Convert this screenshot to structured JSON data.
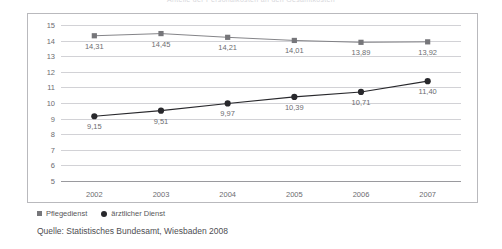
{
  "chart_data": {
    "type": "line",
    "title": "Anteile der Personalkosten an den Gesamtkosten",
    "categories": [
      "2002",
      "2003",
      "2004",
      "2005",
      "2006",
      "2007"
    ],
    "series": [
      {
        "name": "Pflegedienst",
        "marker": "square",
        "color": "#76767a",
        "values": [
          14.31,
          14.45,
          14.21,
          14.01,
          13.89,
          13.92
        ],
        "labels": [
          "14,31",
          "14,45",
          "14,21",
          "14,01",
          "13,89",
          "13,92"
        ]
      },
      {
        "name": "ärztlicher Dienst",
        "marker": "circle",
        "color": "#28282c",
        "values": [
          9.15,
          9.51,
          9.97,
          10.39,
          10.71,
          11.4
        ],
        "labels": [
          "9,15",
          "9,51",
          "9,97",
          "10,39",
          "10,71",
          "11,40"
        ]
      }
    ],
    "ylim": [
      5,
      15
    ],
    "yticks": [
      15,
      14,
      13,
      12,
      11,
      10,
      9,
      8,
      7,
      6,
      5
    ],
    "ytick_labels": [
      "15",
      "14",
      "13",
      "12",
      "11",
      "10",
      "9",
      "8",
      "7",
      "6",
      "5"
    ],
    "xlabel": "",
    "ylabel": "",
    "grid": true,
    "legend_position": "bottom-left"
  },
  "source": {
    "text": "Quelle: Statistisches Bundesamt, Wiesbaden 2008"
  },
  "colors": {
    "grid": "#d2d2d6",
    "axis": "#9a9a9e",
    "frame": "#b9b9bd",
    "text": "#6c6c70"
  }
}
